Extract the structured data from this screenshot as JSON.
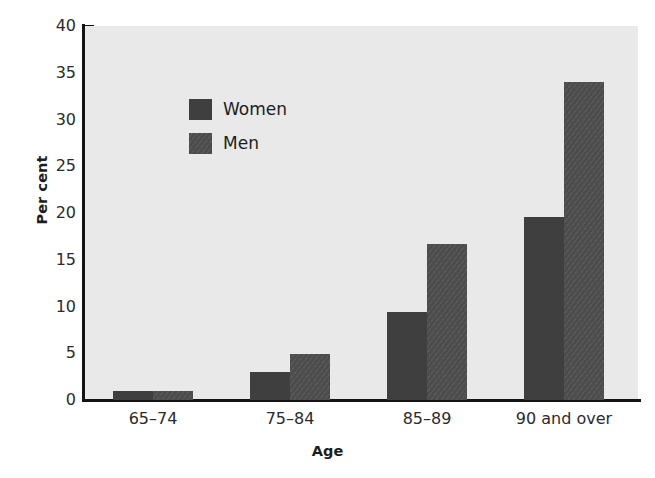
{
  "chart_data": {
    "type": "bar",
    "title": "",
    "xlabel": "Age",
    "ylabel": "Per cent",
    "categories": [
      "65–74",
      "75–84",
      "85–89",
      "90 and over"
    ],
    "series": [
      {
        "name": "Women",
        "color": "#3f3f3f",
        "values": [
          1.0,
          3.0,
          9.4,
          19.6
        ]
      },
      {
        "name": "Men",
        "color": "#4c4c4c",
        "values": [
          1.0,
          4.9,
          16.7,
          34.0
        ]
      }
    ],
    "ylim": [
      0,
      40
    ],
    "yticks": [
      0,
      5,
      10,
      15,
      20,
      25,
      30,
      35,
      40
    ],
    "ytick_labels": [
      "0",
      "5",
      "10",
      "15",
      "20",
      "25",
      "30",
      "35",
      "40"
    ],
    "grid": false,
    "legend_position": "top-left",
    "plot_background": "#e9e9e9",
    "axis_color": "#141414"
  },
  "legend": {
    "items": [
      {
        "label": "Women",
        "key": "women"
      },
      {
        "label": "Men",
        "key": "men"
      }
    ]
  }
}
